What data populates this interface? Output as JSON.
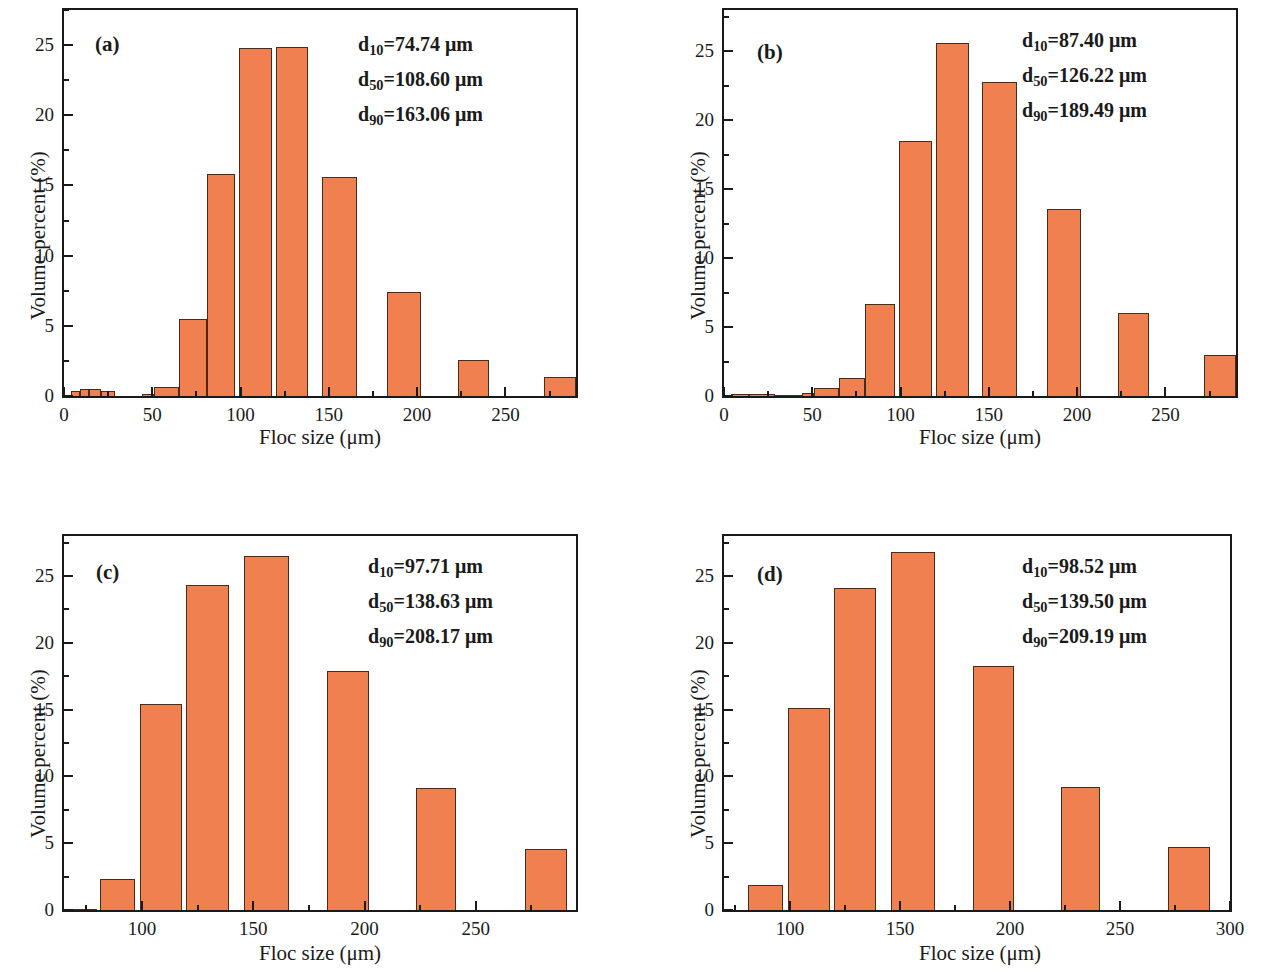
{
  "figure": {
    "panel_count": 4,
    "bar_color": "#F08050",
    "bar_edge_color": "#4a2a18",
    "axis_color": "#1a1a1a",
    "background": "#ffffff"
  },
  "common": {
    "xlabel": "Floc size (μm)",
    "ylabel": "Volume percent (%)",
    "unit": "μm"
  },
  "panels": [
    {
      "letter": "(a)",
      "stats": [
        {
          "name": "d",
          "sub": "10",
          "eq": "=74.74 μm"
        },
        {
          "name": "d",
          "sub": "50",
          "eq": "=108.60 μm"
        },
        {
          "name": "d",
          "sub": "90",
          "eq": "=163.06 μm"
        }
      ],
      "xlabel": "Floc size (μm)",
      "ylabel": "Volume percent (%)",
      "xticks": [
        0,
        50,
        100,
        150,
        200,
        250
      ],
      "yticks": [
        0,
        5,
        10,
        15,
        20,
        25
      ]
    },
    {
      "letter": "(b)",
      "stats": [
        {
          "name": "d",
          "sub": "10",
          "eq": "=87.40 μm"
        },
        {
          "name": "d",
          "sub": "50",
          "eq": "=126.22 μm"
        },
        {
          "name": "d",
          "sub": "90",
          "eq": "=189.49 μm"
        }
      ],
      "xlabel": "Floc size (μm)",
      "ylabel": "Volume percent (%)",
      "xticks": [
        0,
        50,
        100,
        150,
        200,
        250
      ],
      "yticks": [
        0,
        5,
        10,
        15,
        20,
        25
      ]
    },
    {
      "letter": "(c)",
      "stats": [
        {
          "name": "d",
          "sub": "10",
          "eq": "=97.71 μm"
        },
        {
          "name": "d",
          "sub": "50",
          "eq": "=138.63 μm"
        },
        {
          "name": "d",
          "sub": "90",
          "eq": "=208.17 μm"
        }
      ],
      "xlabel": "Floc size (μm)",
      "ylabel": "Volume percent (%)",
      "xticks": [
        100,
        150,
        200,
        250
      ],
      "yticks": [
        0,
        5,
        10,
        15,
        20,
        25
      ]
    },
    {
      "letter": "(d)",
      "stats": [
        {
          "name": "d",
          "sub": "10",
          "eq": "=98.52 μm"
        },
        {
          "name": "d",
          "sub": "50",
          "eq": "=139.50 μm"
        },
        {
          "name": "d",
          "sub": "90",
          "eq": "=209.19 μm"
        }
      ],
      "xlabel": "Floc size (μm)",
      "ylabel": "Volume percent (%)",
      "xticks": [
        100,
        150,
        200,
        250,
        300
      ],
      "yticks": [
        0,
        5,
        10,
        15,
        20,
        25
      ]
    }
  ],
  "chart_data": [
    {
      "type": "bar",
      "title": "(a)",
      "xlabel": "Floc size (μm)",
      "ylabel": "Volume percent (%)",
      "xlim": [
        0,
        290
      ],
      "ylim": [
        0,
        27.5
      ],
      "xticks": [
        0,
        50,
        100,
        150,
        200,
        250
      ],
      "yticks": [
        0,
        5,
        10,
        15,
        20,
        25
      ],
      "grid": false,
      "legend": "none",
      "annotations": [
        "d10=74.74 μm",
        "d50=108.60 μm",
        "d90=163.06 μm"
      ],
      "bins": [
        {
          "left": 4,
          "right": 9,
          "value": 0.35
        },
        {
          "left": 9,
          "right": 14,
          "value": 0.5
        },
        {
          "left": 14,
          "right": 21,
          "value": 0.5
        },
        {
          "left": 21,
          "right": 29,
          "value": 0.35
        },
        {
          "left": 44,
          "right": 51,
          "value": 0.12
        },
        {
          "left": 51,
          "right": 65,
          "value": 0.65
        },
        {
          "left": 65,
          "right": 81,
          "value": 5.5
        },
        {
          "left": 81,
          "right": 97,
          "value": 15.85
        },
        {
          "left": 99,
          "right": 118,
          "value": 24.8
        },
        {
          "left": 120,
          "right": 138,
          "value": 24.85
        },
        {
          "left": 146,
          "right": 166,
          "value": 15.6
        },
        {
          "left": 183,
          "right": 202,
          "value": 7.4
        },
        {
          "left": 223,
          "right": 241,
          "value": 2.55
        },
        {
          "left": 272,
          "right": 290,
          "value": 1.35
        }
      ]
    },
    {
      "type": "bar",
      "title": "(b)",
      "xlabel": "Floc size (μm)",
      "ylabel": "Volume percent (%)",
      "xlim": [
        0,
        290
      ],
      "ylim": [
        0,
        28
      ],
      "xticks": [
        0,
        50,
        100,
        150,
        200,
        250
      ],
      "yticks": [
        0,
        5,
        10,
        15,
        20,
        25
      ],
      "grid": false,
      "legend": "none",
      "annotations": [
        "d10=87.40 μm",
        "d50=126.22 μm",
        "d90=189.49 μm"
      ],
      "bins": [
        {
          "left": 4,
          "right": 14,
          "value": 0.15
        },
        {
          "left": 14,
          "right": 29,
          "value": 0.12
        },
        {
          "left": 29,
          "right": 44,
          "value": 0.1
        },
        {
          "left": 44,
          "right": 51,
          "value": 0.25
        },
        {
          "left": 51,
          "right": 65,
          "value": 0.6
        },
        {
          "left": 65,
          "right": 80,
          "value": 1.3
        },
        {
          "left": 80,
          "right": 97,
          "value": 6.7
        },
        {
          "left": 99,
          "right": 118,
          "value": 18.5
        },
        {
          "left": 120,
          "right": 139,
          "value": 25.6
        },
        {
          "left": 146,
          "right": 166,
          "value": 22.8
        },
        {
          "left": 183,
          "right": 202,
          "value": 13.6
        },
        {
          "left": 223,
          "right": 241,
          "value": 6.0
        },
        {
          "left": 272,
          "right": 290,
          "value": 3.0
        }
      ]
    },
    {
      "type": "bar",
      "title": "(c)",
      "xlabel": "Floc size (μm)",
      "ylabel": "Volume percent (%)",
      "xlim": [
        65,
        295
      ],
      "ylim": [
        0,
        28
      ],
      "xticks": [
        100,
        150,
        200,
        250
      ],
      "yticks": [
        0,
        5,
        10,
        15,
        20,
        25
      ],
      "grid": false,
      "legend": "none",
      "annotations": [
        "d10=97.71 μm",
        "d50=138.63 μm",
        "d90=208.17 μm"
      ],
      "bins": [
        {
          "left": 65,
          "right": 80,
          "value": 0.1
        },
        {
          "left": 81,
          "right": 97,
          "value": 2.3
        },
        {
          "left": 99,
          "right": 118,
          "value": 15.4
        },
        {
          "left": 120,
          "right": 139,
          "value": 24.3
        },
        {
          "left": 146,
          "right": 166,
          "value": 26.5
        },
        {
          "left": 183,
          "right": 202,
          "value": 17.9
        },
        {
          "left": 223,
          "right": 241,
          "value": 9.1
        },
        {
          "left": 272,
          "right": 291,
          "value": 4.6
        }
      ]
    },
    {
      "type": "bar",
      "title": "(d)",
      "xlabel": "Floc size (μm)",
      "ylabel": "Volume percent (%)",
      "xlim": [
        70,
        300
      ],
      "ylim": [
        0,
        28
      ],
      "xticks": [
        100,
        150,
        200,
        250,
        300
      ],
      "yticks": [
        0,
        5,
        10,
        15,
        20,
        25
      ],
      "grid": false,
      "legend": "none",
      "annotations": [
        "d10=98.52 μm",
        "d50=139.50 μm",
        "d90=209.19 μm"
      ],
      "bins": [
        {
          "left": 81,
          "right": 97,
          "value": 1.9
        },
        {
          "left": 99,
          "right": 118,
          "value": 15.1
        },
        {
          "left": 120,
          "right": 139,
          "value": 24.1
        },
        {
          "left": 146,
          "right": 166,
          "value": 26.8
        },
        {
          "left": 183,
          "right": 202,
          "value": 18.3
        },
        {
          "left": 223,
          "right": 241,
          "value": 9.2
        },
        {
          "left": 272,
          "right": 291,
          "value": 4.7
        }
      ]
    }
  ]
}
